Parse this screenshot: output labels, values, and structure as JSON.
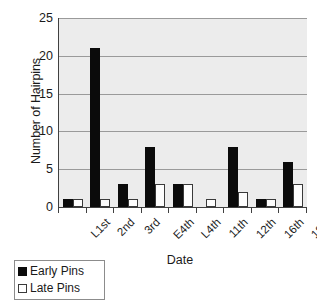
{
  "chart_data": {
    "type": "bar",
    "title": "",
    "xlabel": "Date",
    "ylabel": "Number of Hairpins",
    "categories": [
      "L1st",
      "2nd",
      "3rd",
      "E4th",
      "L4th",
      "11th",
      "12th",
      "16th",
      "18th"
    ],
    "series": [
      {
        "name": "Early Pins",
        "color": "#0b0b0b",
        "values": [
          1,
          21,
          3,
          8,
          3,
          0,
          8,
          1,
          6
        ]
      },
      {
        "name": "Late Pins",
        "color": "#ffffff",
        "values": [
          1,
          1,
          1,
          3,
          3,
          1,
          2,
          1,
          3
        ]
      }
    ],
    "ylim": [
      0,
      25
    ],
    "yticks": [
      0,
      5,
      10,
      15,
      20,
      25
    ],
    "ytick_labels": [
      "0",
      "5",
      "10",
      "15",
      "20",
      "25"
    ],
    "grid": "horizontal",
    "legend_position": "bottom-left",
    "plot_background": "#ececec",
    "axis_color": "#404040",
    "gridline_color": "#9a9a9a"
  }
}
